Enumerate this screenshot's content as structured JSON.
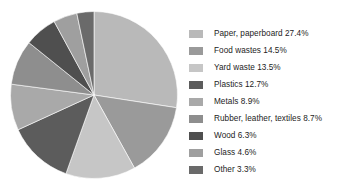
{
  "chart_data": {
    "type": "pie",
    "title": "",
    "subtitle": "",
    "xlabel": "",
    "ylabel": "",
    "legend_position": "right",
    "grid": false,
    "start_angle_deg": 0,
    "direction": "clockwise",
    "units": "percent",
    "categories": [
      "Paper, paperboard",
      "Food wastes",
      "Yard waste",
      "Plastics",
      "Metals",
      "Rubber, leather, textiles",
      "Wood",
      "Glass",
      "Other"
    ],
    "values": [
      27.4,
      14.5,
      13.5,
      12.7,
      8.9,
      8.7,
      6.3,
      4.6,
      3.3
    ],
    "value_labels": [
      "27.4%",
      "14.5%",
      "13.5%",
      "12.7%",
      "8.9%",
      "8.7%",
      "6.3%",
      "4.6%",
      "3.3%"
    ],
    "colors": [
      "#b9b9b9",
      "#9a9a9a",
      "#c6c6c6",
      "#5c5c5c",
      "#a9a9a9",
      "#8e8e8e",
      "#4f4f4f",
      "#9f9f9f",
      "#6a6a6a"
    ],
    "slices": [
      {
        "label": "Paper, paperboard",
        "value": 27.4,
        "value_label": "27.4%",
        "color": "#b9b9b9",
        "legend_text": "Paper, paperboard 27.4%"
      },
      {
        "label": "Food wastes",
        "value": 14.5,
        "value_label": "14.5%",
        "color": "#9a9a9a",
        "legend_text": "Food wastes 14.5%"
      },
      {
        "label": "Yard waste",
        "value": 13.5,
        "value_label": "13.5%",
        "color": "#c6c6c6",
        "legend_text": "Yard waste 13.5%"
      },
      {
        "label": "Plastics",
        "value": 12.7,
        "value_label": "12.7%",
        "color": "#5c5c5c",
        "legend_text": "Plastics 12.7%"
      },
      {
        "label": "Metals",
        "value": 8.9,
        "value_label": "8.9%",
        "color": "#a9a9a9",
        "legend_text": "Metals 8.9%"
      },
      {
        "label": "Rubber, leather, textiles",
        "value": 8.7,
        "value_label": "8.7%",
        "color": "#8e8e8e",
        "legend_text": "Rubber, leather, textiles 8.7%"
      },
      {
        "label": "Wood",
        "value": 6.3,
        "value_label": "6.3%",
        "color": "#4f4f4f",
        "legend_text": "Wood 6.3%"
      },
      {
        "label": "Glass",
        "value": 4.6,
        "value_label": "4.6%",
        "color": "#9f9f9f",
        "legend_text": "Glass 4.6%"
      },
      {
        "label": "Other",
        "value": 3.3,
        "value_label": "3.3%",
        "color": "#6a6a6a",
        "legend_text": "Other 3.3%"
      }
    ]
  },
  "geometry": {
    "center_x": 94,
    "center_y": 95,
    "radius": 83.5,
    "background": "#ffffff",
    "slice_edge_color": "#ffffff",
    "slice_edge_width": 0.6
  }
}
